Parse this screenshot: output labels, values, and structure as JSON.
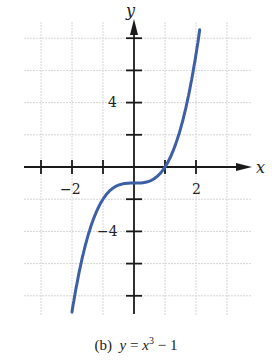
{
  "chart_data": {
    "type": "line",
    "caption_prefix": "(b)",
    "equation": "y = x^3 - 1",
    "xlabel": "x",
    "ylabel": "y",
    "xlim": [
      -3.0,
      3.7
    ],
    "ylim": [
      -9.2,
      9.2
    ],
    "grid": true,
    "x_ticks": [
      -3,
      -2,
      -1,
      1,
      2
    ],
    "x_tick_labels": {
      "-2": "-2",
      "2": "2"
    },
    "y_ticks": [
      -8,
      -6,
      -4,
      -2,
      2,
      4,
      6,
      8
    ],
    "y_tick_labels": {
      "4": "4",
      "-4": "-4"
    },
    "x_grid": [
      -3,
      -2,
      -1,
      1,
      2,
      3
    ],
    "y_grid": [
      -8,
      -6,
      -4,
      -2,
      2,
      4,
      6,
      8
    ],
    "series": [
      {
        "name": "y = x^3 - 1",
        "color": "#3d5fa6",
        "x": [
          -2.1,
          -2.0,
          -1.75,
          -1.5,
          -1.25,
          -1.0,
          -0.75,
          -0.5,
          -0.25,
          0,
          0.25,
          0.5,
          0.75,
          1.0,
          1.25,
          1.5,
          1.75,
          2.0,
          2.1
        ],
        "y": [
          -10.26,
          -9.0,
          -6.36,
          -4.38,
          -2.95,
          -2.0,
          -1.42,
          -1.13,
          -1.02,
          -1.0,
          -0.98,
          -0.88,
          -0.58,
          0.0,
          0.95,
          2.38,
          4.36,
          7.0,
          8.26
        ]
      }
    ]
  },
  "caption": {
    "prefix": "(b)",
    "lhs": "y",
    "eq": " = ",
    "base": "x",
    "exp": "3",
    "rest": " − 1"
  },
  "axis_labels": {
    "x": "x",
    "y": "y"
  },
  "tick_labels": {
    "x_neg2": "−2",
    "x_pos2": "2",
    "y_pos4": "4",
    "y_neg4": "−4"
  }
}
